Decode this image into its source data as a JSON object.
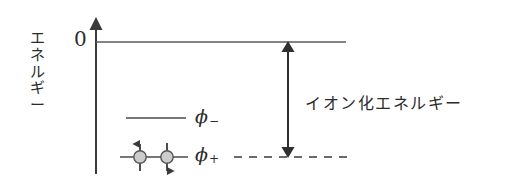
{
  "figure": {
    "axis": {
      "y_axis_name": "energy-axis",
      "y_axis_label": "エネルギー",
      "y_axis_label_chars": [
        "エ",
        "ネ",
        "ル",
        "ギ",
        "ー"
      ],
      "zero_tick_label": "0",
      "vacuum_level_name": "vacuum-level-line"
    },
    "levels": [
      {
        "id": "phi-minus",
        "label_base": "ϕ",
        "label_sub": "−",
        "occupancy": 0,
        "electrons": []
      },
      {
        "id": "phi-plus",
        "label_base": "ϕ",
        "label_sub": "+",
        "occupancy": 2,
        "electrons": [
          "spin-up",
          "spin-down"
        ]
      }
    ],
    "annotation": {
      "name": "ionization-energy-arrow",
      "label": "イオン化エネルギー",
      "arrow_style": "double-headed-vertical"
    },
    "colors": {
      "line": "#3a3a3a",
      "text": "#2b2b2b",
      "electron_fill": "#cccccc",
      "electron_stroke": "#555555",
      "background": "#ffffff"
    }
  }
}
